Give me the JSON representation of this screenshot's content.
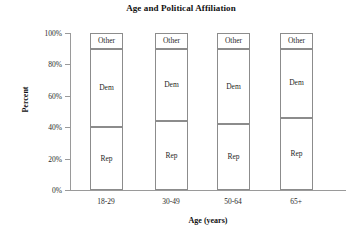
{
  "chart_data": {
    "type": "bar",
    "subtype": "stacked-bar-100-percent",
    "title": "Age and Political Affiliation",
    "xlabel": "Age (years)",
    "ylabel": "Percent",
    "categories": [
      "18-29",
      "30-49",
      "50-64",
      "65+"
    ],
    "series": [
      {
        "name": "Rep",
        "values": [
          40,
          44,
          42,
          46
        ]
      },
      {
        "name": "Dem",
        "values": [
          50,
          46,
          48,
          44
        ]
      },
      {
        "name": "Other",
        "values": [
          10,
          10,
          10,
          10
        ]
      }
    ],
    "ylim": [
      0,
      100
    ],
    "yticks": [
      0,
      20,
      40,
      60,
      80,
      100
    ],
    "ytick_labels": [
      "0%",
      "20%",
      "40%",
      "60%",
      "80%",
      "100%"
    ],
    "grid": false,
    "legend": "none",
    "segment_labels_inline": true,
    "colors": {
      "bar_fill": "#ffffff",
      "bar_border": "#8c8c8c",
      "axis": "#9a9a9a",
      "text": "#1a1a1a",
      "background": "#ffffff"
    }
  },
  "axes": {
    "y_ticks": [
      {
        "label": "100%",
        "value": 100
      },
      {
        "label": "80%",
        "value": 80
      },
      {
        "label": "60%",
        "value": 60
      },
      {
        "label": "40%",
        "value": 40
      },
      {
        "label": "20%",
        "value": 20
      },
      {
        "label": "0%",
        "value": 0
      }
    ]
  },
  "bars": [
    {
      "category": "18-29",
      "segments": [
        {
          "name": "Other",
          "label": "Other",
          "start": 90,
          "end": 100
        },
        {
          "name": "Dem",
          "label": "Dem",
          "start": 40,
          "end": 90
        },
        {
          "name": "Rep",
          "label": "Rep",
          "start": 0,
          "end": 40
        }
      ]
    },
    {
      "category": "30-49",
      "segments": [
        {
          "name": "Other",
          "label": "Other",
          "start": 90,
          "end": 100
        },
        {
          "name": "Dem",
          "label": "Dem",
          "start": 44,
          "end": 90
        },
        {
          "name": "Rep",
          "label": "Rep",
          "start": 0,
          "end": 44
        }
      ]
    },
    {
      "category": "50-64",
      "segments": [
        {
          "name": "Other",
          "label": "Other",
          "start": 90,
          "end": 100
        },
        {
          "name": "Dem",
          "label": "Dem",
          "start": 42,
          "end": 90
        },
        {
          "name": "Rep",
          "label": "Rep",
          "start": 0,
          "end": 42
        }
      ]
    },
    {
      "category": "65+",
      "segments": [
        {
          "name": "Other",
          "label": "Other",
          "start": 90,
          "end": 100
        },
        {
          "name": "Dem",
          "label": "Dem",
          "start": 46,
          "end": 90
        },
        {
          "name": "Rep",
          "label": "Rep",
          "start": 0,
          "end": 46
        }
      ]
    }
  ]
}
